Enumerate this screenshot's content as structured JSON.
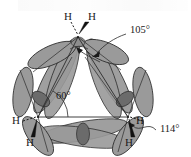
{
  "figure": {
    "background_color": "#ffffff",
    "lobe_color": "#9a9a9a",
    "lobe_overlap_color": "#6b6b6b",
    "stroke_color": "#2b2b2b",
    "text_color": "#1b1b1b"
  },
  "atoms": [
    {
      "id": "h-top-left",
      "label": "H",
      "bond": "dashed",
      "x": 64,
      "y": 16
    },
    {
      "id": "h-top-right",
      "label": "H",
      "bond": "wedge",
      "x": 88,
      "y": 16
    },
    {
      "id": "h-left-upper",
      "label": "H",
      "bond": "dashed",
      "x": 12,
      "y": 120
    },
    {
      "id": "h-left-lower",
      "label": "H",
      "bond": "wedge",
      "x": 26,
      "y": 142
    },
    {
      "id": "h-right-upper",
      "label": "H",
      "bond": "dashed",
      "x": 136,
      "y": 120
    },
    {
      "id": "h-right-lower",
      "label": "H",
      "bond": "wedge",
      "x": 125,
      "y": 142
    }
  ],
  "angles": [
    {
      "id": "angle-hch",
      "label": "105°",
      "x": 128,
      "y": 30,
      "description": "H-C-H angle at apex carbon"
    },
    {
      "id": "angle-ring",
      "label": "60°",
      "x": 57,
      "y": 96,
      "description": "internal C-C-C ring angle"
    },
    {
      "id": "angle-interorb",
      "label": "114°",
      "x": 161,
      "y": 128,
      "description": "interorbital bent bond angle"
    }
  ],
  "ring": {
    "vertices": [
      {
        "id": "carbon-apex",
        "x": 78,
        "y": 37
      },
      {
        "id": "carbon-lower-left",
        "x": 38,
        "y": 117
      },
      {
        "id": "carbon-lower-right",
        "x": 128,
        "y": 117
      }
    ]
  }
}
